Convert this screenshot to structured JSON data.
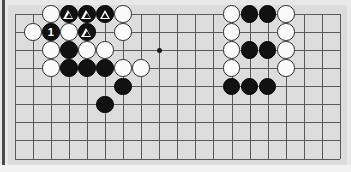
{
  "figure": {
    "kind": "go-board-diagram",
    "board_size_shown": {
      "cols": 19,
      "rows": 9
    },
    "colors": {
      "page_background": "#e8e8e8",
      "board_background": "#dcdcdc",
      "grid_line": "#5a5a5a",
      "black_stone": "#111111",
      "white_stone": "#fbfbfb",
      "stone_outline": "#2b2b2b",
      "marker": "#ffffff",
      "left_rule": "#4a4a4a"
    },
    "geometry": {
      "board_left": 8,
      "board_top": 5,
      "board_width": 339,
      "board_height": 160,
      "origin_x": 14.7,
      "origin_y": 14.0,
      "spacing": 18.07,
      "stone_diameter": 17.5
    }
  },
  "grid": {
    "col_count": 19,
    "row_count": 9,
    "col_labels": [
      "1",
      "2",
      "3",
      "4",
      "5",
      "6",
      "7",
      "8",
      "9",
      "10",
      "11",
      "12",
      "13",
      "14",
      "15",
      "16",
      "17",
      "18",
      "19"
    ],
    "row_labels": [
      "1",
      "2",
      "3",
      "4",
      "5",
      "6",
      "7",
      "8",
      "9"
    ]
  },
  "hoshi": [
    {
      "name": "star-point-left",
      "col": 9,
      "row": 3
    },
    {
      "name": "star-point-right",
      "col": 15,
      "row": 3
    }
  ],
  "stones": [
    {
      "id": "w-c3-r1",
      "color": "white",
      "col": 3,
      "row": 1,
      "marker": "none",
      "label": ""
    },
    {
      "id": "b-c4-r1",
      "color": "black",
      "col": 4,
      "row": 1,
      "marker": "triangle",
      "label": ""
    },
    {
      "id": "b-c5-r1",
      "color": "black",
      "col": 5,
      "row": 1,
      "marker": "triangle",
      "label": ""
    },
    {
      "id": "b-c6-r1",
      "color": "black",
      "col": 6,
      "row": 1,
      "marker": "triangle",
      "label": ""
    },
    {
      "id": "w-c7-r1",
      "color": "white",
      "col": 7,
      "row": 1,
      "marker": "none",
      "label": ""
    },
    {
      "id": "w-c2-r2",
      "color": "white",
      "col": 2,
      "row": 2,
      "marker": "none",
      "label": ""
    },
    {
      "id": "b-c3-r2",
      "color": "black",
      "col": 3,
      "row": 2,
      "marker": "number",
      "label": "1"
    },
    {
      "id": "w-c4-r2",
      "color": "white",
      "col": 4,
      "row": 2,
      "marker": "none",
      "label": ""
    },
    {
      "id": "b-c5-r2",
      "color": "black",
      "col": 5,
      "row": 2,
      "marker": "triangle",
      "label": ""
    },
    {
      "id": "w-c7-r2",
      "color": "white",
      "col": 7,
      "row": 2,
      "marker": "none",
      "label": ""
    },
    {
      "id": "w-c3-r3",
      "color": "white",
      "col": 3,
      "row": 3,
      "marker": "none",
      "label": ""
    },
    {
      "id": "b-c4-r3",
      "color": "black",
      "col": 4,
      "row": 3,
      "marker": "none",
      "label": ""
    },
    {
      "id": "w-c5-r3",
      "color": "white",
      "col": 5,
      "row": 3,
      "marker": "none",
      "label": ""
    },
    {
      "id": "w-c6-r3",
      "color": "white",
      "col": 6,
      "row": 3,
      "marker": "none",
      "label": ""
    },
    {
      "id": "w-c3-r4",
      "color": "white",
      "col": 3,
      "row": 4,
      "marker": "none",
      "label": ""
    },
    {
      "id": "b-c4-r4",
      "color": "black",
      "col": 4,
      "row": 4,
      "marker": "none",
      "label": ""
    },
    {
      "id": "b-c5-r4",
      "color": "black",
      "col": 5,
      "row": 4,
      "marker": "none",
      "label": ""
    },
    {
      "id": "b-c6-r4",
      "color": "black",
      "col": 6,
      "row": 4,
      "marker": "none",
      "label": ""
    },
    {
      "id": "w-c7-r4",
      "color": "white",
      "col": 7,
      "row": 4,
      "marker": "none",
      "label": ""
    },
    {
      "id": "w-c8-r4",
      "color": "white",
      "col": 8,
      "row": 4,
      "marker": "none",
      "label": ""
    },
    {
      "id": "b-c7-r5",
      "color": "black",
      "col": 7,
      "row": 5,
      "marker": "none",
      "label": ""
    },
    {
      "id": "b-c6-r6",
      "color": "black",
      "col": 6,
      "row": 6,
      "marker": "none",
      "label": ""
    },
    {
      "id": "w-c13-r1",
      "color": "white",
      "col": 13,
      "row": 1,
      "marker": "none",
      "label": ""
    },
    {
      "id": "b-c14-r1",
      "color": "black",
      "col": 14,
      "row": 1,
      "marker": "none",
      "label": ""
    },
    {
      "id": "b-c15-r1",
      "color": "black",
      "col": 15,
      "row": 1,
      "marker": "none",
      "label": ""
    },
    {
      "id": "w-c16-r1",
      "color": "white",
      "col": 16,
      "row": 1,
      "marker": "none",
      "label": ""
    },
    {
      "id": "w-c13-r2",
      "color": "white",
      "col": 13,
      "row": 2,
      "marker": "none",
      "label": ""
    },
    {
      "id": "w-c16-r2",
      "color": "white",
      "col": 16,
      "row": 2,
      "marker": "none",
      "label": ""
    },
    {
      "id": "w-c13-r3",
      "color": "white",
      "col": 13,
      "row": 3,
      "marker": "none",
      "label": ""
    },
    {
      "id": "b-c14-r3",
      "color": "black",
      "col": 14,
      "row": 3,
      "marker": "none",
      "label": ""
    },
    {
      "id": "b-c15-r3",
      "color": "black",
      "col": 15,
      "row": 3,
      "marker": "none",
      "label": ""
    },
    {
      "id": "w-c16-r3",
      "color": "white",
      "col": 16,
      "row": 3,
      "marker": "none",
      "label": ""
    },
    {
      "id": "w-c13-r4",
      "color": "white",
      "col": 13,
      "row": 4,
      "marker": "none",
      "label": ""
    },
    {
      "id": "w-c16-r4",
      "color": "white",
      "col": 16,
      "row": 4,
      "marker": "none",
      "label": ""
    },
    {
      "id": "b-c13-r5",
      "color": "black",
      "col": 13,
      "row": 5,
      "marker": "none",
      "label": ""
    },
    {
      "id": "b-c14-r5",
      "color": "black",
      "col": 14,
      "row": 5,
      "marker": "none",
      "label": ""
    },
    {
      "id": "b-c15-r5",
      "color": "black",
      "col": 15,
      "row": 5,
      "marker": "none",
      "label": ""
    }
  ]
}
